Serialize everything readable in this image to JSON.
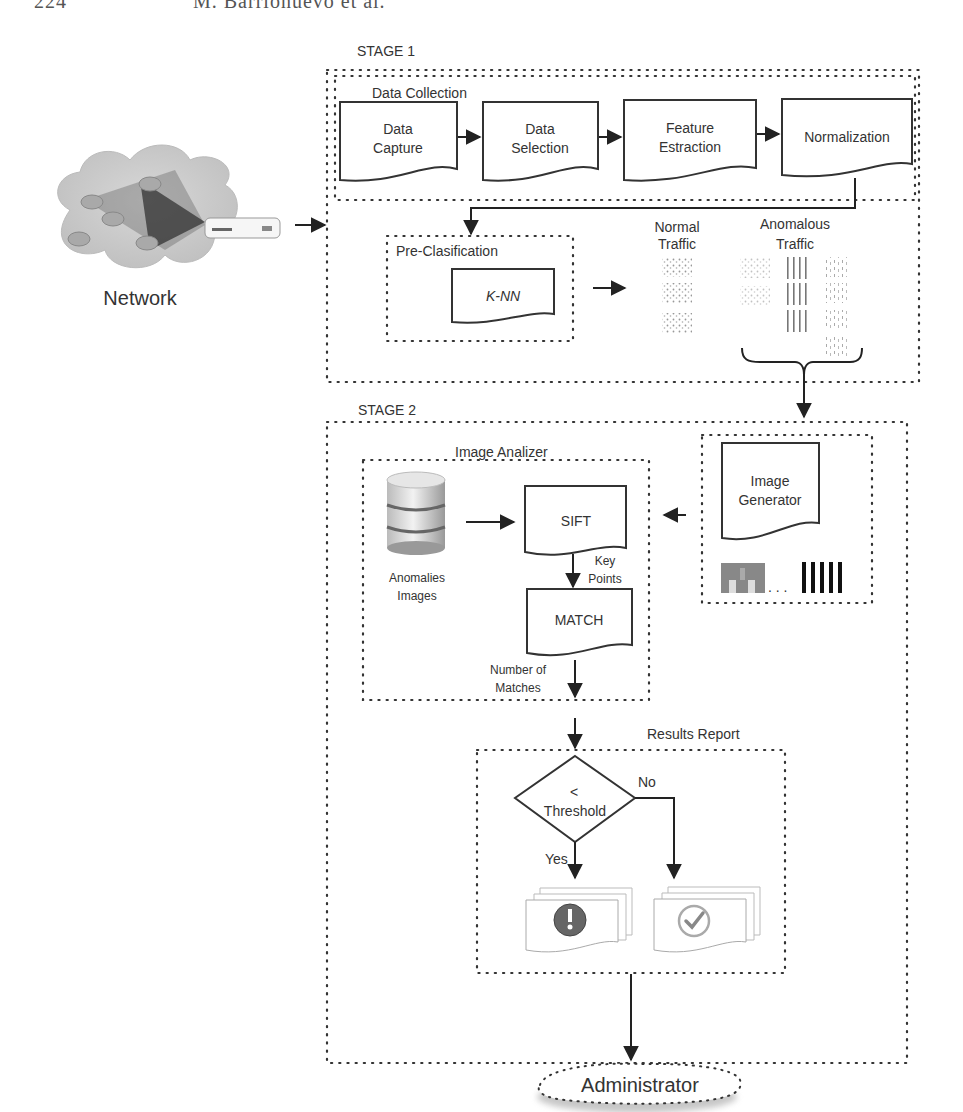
{
  "page_header": {
    "page_number": "224",
    "running_head": "M. Barrionuevo et al."
  },
  "network": {
    "label": "Network",
    "icon": "network-cloud-icon",
    "device_icon": "router-icon"
  },
  "stage1": {
    "title": "STAGE 1",
    "data_collection": {
      "title": "Data Collection",
      "steps": [
        {
          "line1": "Data",
          "line2": "Capture"
        },
        {
          "line1": "Data",
          "line2": "Selection"
        },
        {
          "line1": "Feature",
          "line2": "Estraction"
        },
        {
          "line1": "Normalization",
          "line2": ""
        }
      ]
    },
    "pre_classification": {
      "title": "Pre-Clasification",
      "algorithm": "K-NN"
    },
    "normal_traffic": {
      "line1": "Normal",
      "line2": "Traffic"
    },
    "anomalous_traffic": {
      "line1": "Anomalous",
      "line2": "Traffic"
    }
  },
  "stage2": {
    "title": "STAGE 2",
    "image_analyzer": {
      "title": "Image Analizer",
      "database": {
        "line1": "Anomalies",
        "line2": "Images",
        "icon": "database-icon"
      },
      "sift": "SIFT",
      "key_points": {
        "line1": "Key",
        "line2": "Points"
      },
      "match": "MATCH",
      "number_of_matches": {
        "line1": "Number of",
        "line2": "Matches"
      }
    },
    "image_generator": {
      "line1": "Image",
      "line2": "Generator",
      "ellipsis": ". . ."
    },
    "results_report": {
      "title": "Results Report",
      "decision": {
        "symbol": "<",
        "label": "Threshold"
      },
      "yes": "Yes",
      "no": "No",
      "alert_icon": "exclamation-icon",
      "ok_icon": "checkmark-icon"
    }
  },
  "administrator": {
    "label": "Administrator"
  }
}
